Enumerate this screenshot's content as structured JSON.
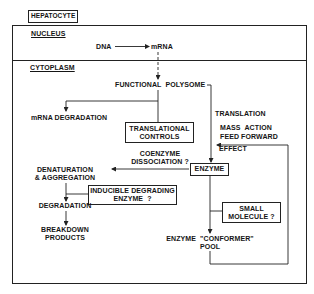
{
  "title": "HEPATOCYTE",
  "compartments": {
    "nucleus": "NUCLEUS",
    "cytoplasm": "CYTOPLASM"
  },
  "nodes": {
    "dna": "DNA",
    "mrna": "mRNA",
    "functional_polysome": "FUNCTIONAL  POLYSOME",
    "mrna_degradation": "mRNA DEGRADATION",
    "translational_controls_1": "TRANSLATIONAL",
    "translational_controls_2": "CONTROLS",
    "translation": "TRANSLATION",
    "mass_action": "MASS  ACTION",
    "feed_forward": "FEED FORWARD",
    "effect": "EFFECT",
    "coenzyme": "COENZYME",
    "dissociation": "DISSOCIATION ?",
    "enzyme": "ENZYME",
    "denaturation": "DENATURATION",
    "aggregation": "& AGGREGATION",
    "inducible_1": "INDUCIBLE DEGRADING",
    "inducible_2": "ENZYME  ?",
    "degradation": "DEGRADATION",
    "breakdown_1": "BREAKDOWN",
    "breakdown_2": "PRODUCTS",
    "small_molecule_1": "SMALL",
    "small_molecule_2": "MOLECULE ?",
    "conformer_pool_1": "ENZYME  \"CONFORMER\"",
    "conformer_pool_2": "POOL"
  }
}
